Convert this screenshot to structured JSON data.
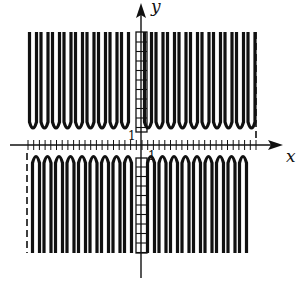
{
  "figure": {
    "x_axis_label": "x",
    "y_axis_label": "y",
    "tick_label_x": "1",
    "tick_label_y": "1",
    "colors": {
      "ink": "#111111",
      "background": "#ffffff"
    }
  }
}
